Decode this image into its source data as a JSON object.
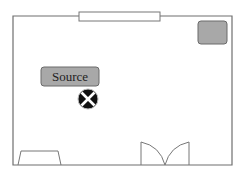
{
  "diagram": {
    "title": "",
    "elements": {
      "source": {
        "label": "Source",
        "fill": "#a8a8a8",
        "stroke": "#6a6a6a"
      },
      "corner_object": {
        "label": "",
        "fill": "#a8a8a8",
        "stroke": "#6a6a6a"
      },
      "receiver": {
        "icon": "circled-x-icon",
        "fill": "#111111",
        "mark": "#ffffff"
      },
      "window": {
        "label": ""
      },
      "door": {
        "type": "double-door",
        "label": ""
      },
      "furniture": {
        "shape": "trapezoid",
        "label": ""
      }
    },
    "colors": {
      "wall": "#6f6f6f",
      "background": "#ffffff",
      "gray_object": "#a8a8a8"
    }
  }
}
